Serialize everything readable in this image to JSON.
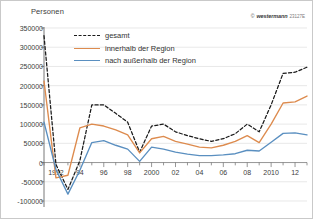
{
  "axis_label": "Personen",
  "copyright": {
    "mark": "©",
    "brand": "westermann",
    "code": "23127E"
  },
  "legend": [
    {
      "label": "gesamt",
      "color": "#1a1a1a",
      "style": "dashed"
    },
    {
      "label": "innerhalb der Region",
      "color": "#dd8b4e",
      "style": "solid"
    },
    {
      "label": "nach außerhalb der Region",
      "color": "#5a8fc0",
      "style": "solid"
    }
  ],
  "chart_data": {
    "type": "line",
    "title": "",
    "xlabel": "",
    "ylabel": "Personen",
    "ylim": [
      -100000,
      350000
    ],
    "xlim": [
      1991,
      2013
    ],
    "grid": true,
    "legend_position": "top-left-inside",
    "yticks": [
      350000,
      300000,
      250000,
      200000,
      150000,
      100000,
      50000,
      0,
      -50000,
      -100000
    ],
    "ytick_labels": [
      "350000",
      "300000",
      "250000",
      "200000",
      "150000",
      "100000",
      "50000",
      "0",
      "-50000",
      "-100000"
    ],
    "x": [
      1991,
      1992,
      1993,
      1994,
      1995,
      1996,
      1997,
      1998,
      1999,
      2000,
      2001,
      2002,
      2003,
      2004,
      2005,
      2006,
      2007,
      2008,
      2009,
      2010,
      2011,
      2012,
      2013
    ],
    "xtick_labels": [
      "",
      "1992",
      "",
      "94",
      "",
      "96",
      "",
      "98",
      "",
      "2000",
      "",
      "02",
      "",
      "04",
      "",
      "06",
      "",
      "08",
      "",
      "2010",
      "",
      "12",
      ""
    ],
    "series": [
      {
        "name": "gesamt",
        "color": "#1a1a1a",
        "style": "dashed",
        "values": [
          330000,
          -5000,
          -70000,
          5000,
          150000,
          150000,
          128000,
          105000,
          27000,
          95000,
          100000,
          80000,
          70000,
          62000,
          55000,
          62000,
          75000,
          100000,
          80000,
          150000,
          232000,
          235000,
          248000
        ]
      },
      {
        "name": "innerhalb der Region",
        "color": "#dd8b4e",
        "style": "solid",
        "values": [
          212000,
          -40000,
          -33000,
          90000,
          100000,
          95000,
          85000,
          72000,
          25000,
          62000,
          68000,
          55000,
          48000,
          40000,
          38000,
          45000,
          55000,
          70000,
          52000,
          100000,
          155000,
          158000,
          173000
        ]
      },
      {
        "name": "nach außerhalb der Region",
        "color": "#5a8fc0",
        "style": "solid",
        "values": [
          105000,
          -18000,
          -82000,
          -20000,
          52000,
          57000,
          45000,
          35000,
          3000,
          40000,
          35000,
          27000,
          22000,
          18000,
          18000,
          20000,
          23000,
          32000,
          30000,
          53000,
          76000,
          77000,
          72000
        ]
      }
    ]
  }
}
